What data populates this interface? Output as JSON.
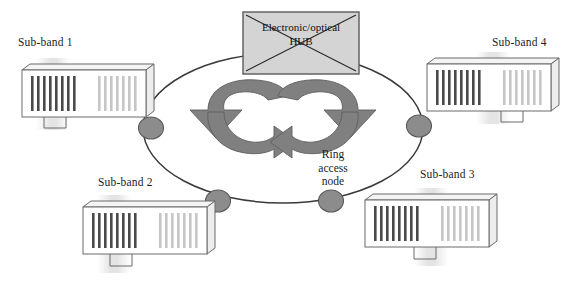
{
  "figure": {
    "kind": "ring-network-diagram",
    "background_color": "#ffffff"
  },
  "hub": {
    "line1": "Electronic/optical",
    "line2": "HUB",
    "crossed_out": true,
    "fill_color": "#d4d4d4",
    "border_color": "#5a5a5a",
    "cross_color": "#2a2a2a"
  },
  "ring": {
    "stroke_color": "#3a3a3a",
    "node_fill": "#8c8c8c",
    "node_stroke": "#5a5a5a",
    "node_count": 4,
    "node_label": {
      "line1": "Ring",
      "line2": "access",
      "line3": "node"
    }
  },
  "arrows": {
    "fill_color": "#808080",
    "stroke_color": "#5a5a5a",
    "left_direction": "clockwise",
    "right_direction": "counter-clockwise",
    "count": 2
  },
  "subbands": [
    {
      "id": "sub-band-1",
      "label": "Sub-band 1",
      "position": "top-left",
      "dark_bars": 8,
      "light_bars": 7
    },
    {
      "id": "sub-band-2",
      "label": "Sub-band 2",
      "position": "bottom-left",
      "dark_bars": 8,
      "light_bars": 7
    },
    {
      "id": "sub-band-3",
      "label": "Sub-band 3",
      "position": "bottom-right",
      "dark_bars": 8,
      "light_bars": 7
    },
    {
      "id": "sub-band-4",
      "label": "Sub-band 4",
      "position": "top-right",
      "dark_bars": 8,
      "light_bars": 7
    }
  ],
  "device_style": {
    "body_fill": "#ffffff",
    "body_stroke": "#6a6a6a",
    "top_face_fill": "#f2f2f2",
    "dark_bar_color": "#4a4a4a",
    "light_bar_color": "#c8c8c8",
    "foot_stroke": "#6a6a6a"
  }
}
